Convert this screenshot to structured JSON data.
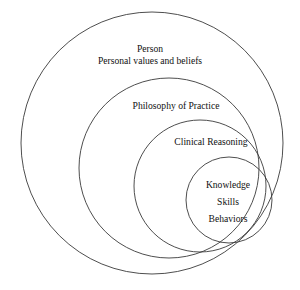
{
  "diagram": {
    "type": "concentric-nested-circles",
    "background_color": "#ffffff",
    "stroke_color": "#3a3a3a",
    "text_color": "#111111",
    "rings": [
      {
        "id": "person",
        "level": 1,
        "cx": 152,
        "cy": 143,
        "r": 131,
        "label_lines": [
          "Person",
          "Personal values and beliefs"
        ]
      },
      {
        "id": "philosophy",
        "level": 2,
        "cx": 169,
        "cy": 168,
        "r": 90,
        "label_lines": [
          "Philosophy of Practice"
        ]
      },
      {
        "id": "clinical-reasoning",
        "level": 3,
        "cx": 200,
        "cy": 186,
        "r": 66,
        "label_lines": [
          "Clinical Reasoning"
        ]
      },
      {
        "id": "core",
        "level": 4,
        "cx": 229,
        "cy": 200,
        "r": 43,
        "label_lines": [
          "Knowledge",
          "Skills",
          "Behaviors"
        ]
      }
    ],
    "labels": {
      "person_line1": "Person",
      "person_line2": "Personal values and beliefs",
      "philosophy": "Philosophy of Practice",
      "clinical_reasoning": "Clinical Reasoning",
      "knowledge": "Knowledge",
      "skills": "Skills",
      "behaviors": "Behaviors"
    }
  }
}
